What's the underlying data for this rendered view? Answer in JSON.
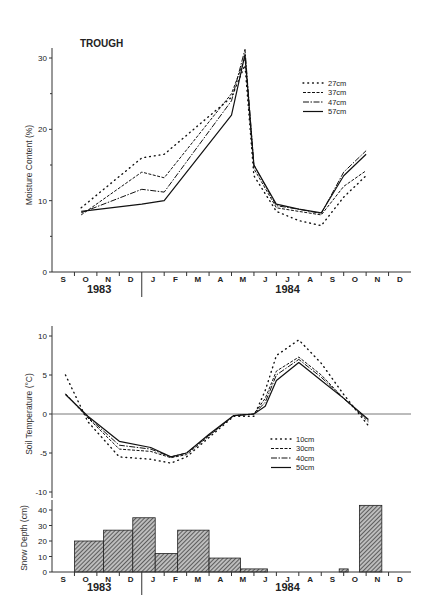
{
  "chart_data": [
    {
      "type": "line",
      "title": "TROUGH",
      "xlabel": "",
      "ylabel": "Moisture Content (%)",
      "ylim": [
        0,
        31
      ],
      "yticks": [
        0,
        10,
        20,
        30
      ],
      "grid": false,
      "legend_position": "upper right",
      "months": [
        "S",
        "O",
        "N",
        "D",
        "J",
        "F",
        "M",
        "A",
        "M",
        "J",
        "J",
        "A",
        "S",
        "O",
        "N",
        "D"
      ],
      "years": [
        {
          "label": "1983"
        },
        {
          "label": "1984"
        }
      ],
      "x_month_index": [
        1.3,
        4.0,
        5.0,
        8.0,
        8.6,
        9.0,
        10.0,
        11.0,
        12.0,
        13.0,
        14.0
      ],
      "series": [
        {
          "name": "27cm",
          "style": "dotted",
          "values": [
            9.0,
            16.0,
            16.5,
            24.5,
            29.0,
            13.5,
            8.5,
            7.2,
            6.5,
            10.5,
            13.5
          ]
        },
        {
          "name": "37cm",
          "style": "dashed",
          "values": [
            8.0,
            14.0,
            13.2,
            25.0,
            30.0,
            14.5,
            9.0,
            8.5,
            8.0,
            12.0,
            14.2
          ]
        },
        {
          "name": "47cm",
          "style": "dashdot",
          "values": [
            8.3,
            11.6,
            11.2,
            24.0,
            31.2,
            15.0,
            9.3,
            8.8,
            8.2,
            14.0,
            17.0
          ]
        },
        {
          "name": "57cm",
          "style": "solid",
          "values": [
            8.5,
            9.5,
            10.0,
            22.0,
            30.5,
            15.0,
            9.5,
            8.8,
            8.3,
            13.5,
            16.5
          ]
        }
      ]
    },
    {
      "type": "line",
      "title": "",
      "xlabel": "",
      "ylabel": "Soil Temperature (°C)",
      "ylim": [
        -10,
        10
      ],
      "yticks": [
        -10,
        -5,
        0,
        5,
        10
      ],
      "grid": false,
      "legend_position": "center right",
      "x_month_index": [
        0.6,
        1.6,
        3.0,
        4.4,
        5.3,
        6.0,
        7.0,
        8.1,
        9.0,
        9.5,
        10.0,
        11.0,
        12.0,
        13.0,
        14.1
      ],
      "series": [
        {
          "name": "10cm",
          "style": "dotted",
          "values": [
            5.0,
            -1.0,
            -5.5,
            -5.8,
            -6.3,
            -5.5,
            -3.0,
            -0.3,
            -0.3,
            3.0,
            7.5,
            9.5,
            6.5,
            2.5,
            -1.5
          ]
        },
        {
          "name": "30cm",
          "style": "dashed",
          "values": [
            2.6,
            -0.5,
            -4.5,
            -4.8,
            -5.6,
            -5.2,
            -2.8,
            -0.2,
            0.0,
            2.0,
            5.5,
            7.3,
            5.0,
            2.0,
            -1.0
          ]
        },
        {
          "name": "40cm",
          "style": "dashdot",
          "values": [
            2.5,
            -0.4,
            -4.0,
            -4.5,
            -5.5,
            -5.0,
            -2.7,
            -0.2,
            0.0,
            1.5,
            5.0,
            7.0,
            4.7,
            2.0,
            -0.8
          ]
        },
        {
          "name": "50cm",
          "style": "solid",
          "values": [
            2.5,
            -0.3,
            -3.5,
            -4.3,
            -5.5,
            -5.0,
            -2.6,
            -0.2,
            0.0,
            1.0,
            4.3,
            6.6,
            4.3,
            2.0,
            -0.7
          ]
        }
      ]
    },
    {
      "type": "bar",
      "title": "",
      "xlabel": "",
      "ylabel": "Snow Depth (cm)",
      "ylim": [
        0,
        45
      ],
      "yticks": [
        0,
        10,
        20,
        30,
        40
      ],
      "grid": false,
      "bars": [
        {
          "start": 1.0,
          "end": 2.3,
          "value": 20
        },
        {
          "start": 2.3,
          "end": 3.6,
          "value": 27
        },
        {
          "start": 3.6,
          "end": 4.6,
          "value": 35
        },
        {
          "start": 4.6,
          "end": 5.6,
          "value": 12
        },
        {
          "start": 5.6,
          "end": 7.0,
          "value": 27
        },
        {
          "start": 7.0,
          "end": 8.4,
          "value": 9
        },
        {
          "start": 8.4,
          "end": 9.6,
          "value": 2
        },
        {
          "start": 12.8,
          "end": 13.2,
          "value": 2
        },
        {
          "start": 13.7,
          "end": 14.7,
          "value": 43
        }
      ]
    }
  ],
  "labels": {
    "title": "TROUGH",
    "moisture_ylabel": "Moisture Content (%)",
    "temp_ylabel": "Soil Temperature (°C)",
    "snow_ylabel": "Snow Depth (cm)",
    "year_1983": "1983",
    "year_1984": "1984"
  }
}
